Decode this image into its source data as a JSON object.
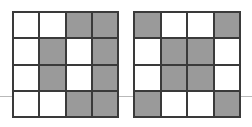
{
  "figure": {
    "name": "two-shaded-4x4-grids",
    "background_color": "#ffffff"
  },
  "palette": {
    "shaded_color": "#9a9a9a",
    "empty_color": "#ffffff",
    "line_color": "#3a3a3a",
    "rule_color": "#b9b9b9"
  },
  "horizontal_rule": {
    "name": "baseline-rule",
    "y": 96,
    "color": "#b9b9b9"
  },
  "chart_data": {
    "type": "heatmap",
    "title": "",
    "xlabel": "",
    "ylabel": "",
    "rows": 4,
    "columns": 4,
    "legend": [
      {
        "key": "shaded",
        "label": "shaded",
        "color": "#9a9a9a"
      },
      {
        "key": "empty",
        "label": "empty",
        "color": "#ffffff"
      }
    ],
    "grids": [
      {
        "name": "left-grid",
        "position": "left",
        "shaded_count": 8,
        "cells": [
          [
            "empty",
            "empty",
            "shaded",
            "shaded"
          ],
          [
            "empty",
            "shaded",
            "empty",
            "shaded"
          ],
          [
            "empty",
            "shaded",
            "empty",
            "shaded"
          ],
          [
            "empty",
            "empty",
            "shaded",
            "shaded"
          ]
        ]
      },
      {
        "name": "right-grid",
        "position": "right",
        "shaded_count": 8,
        "cells": [
          [
            "shaded",
            "empty",
            "empty",
            "shaded"
          ],
          [
            "empty",
            "shaded",
            "shaded",
            "empty"
          ],
          [
            "empty",
            "shaded",
            "shaded",
            "empty"
          ],
          [
            "shaded",
            "empty",
            "empty",
            "shaded"
          ]
        ]
      }
    ]
  }
}
